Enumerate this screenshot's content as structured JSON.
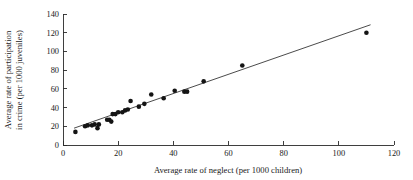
{
  "chart_data": {
    "type": "scatter",
    "title": "",
    "xlabel": "Average rate of neglect (per 1000 children)",
    "ylabel_line1": "Average rate of participation",
    "ylabel_line2": "in crime (per 1000 juveniles)",
    "xlim": [
      0,
      120
    ],
    "ylim": [
      0,
      140
    ],
    "xticks": [
      0,
      20,
      40,
      60,
      80,
      100,
      120
    ],
    "yticks": [
      0,
      20,
      40,
      60,
      80,
      100,
      120,
      140
    ],
    "grid": false,
    "legend": "none",
    "points": [
      {
        "x": 4.5,
        "y": 14
      },
      {
        "x": 8.0,
        "y": 20
      },
      {
        "x": 9.0,
        "y": 21
      },
      {
        "x": 10.5,
        "y": 21
      },
      {
        "x": 11.5,
        "y": 22
      },
      {
        "x": 12.5,
        "y": 18
      },
      {
        "x": 13.0,
        "y": 22
      },
      {
        "x": 16.0,
        "y": 27
      },
      {
        "x": 16.8,
        "y": 27
      },
      {
        "x": 17.5,
        "y": 25
      },
      {
        "x": 18.0,
        "y": 33
      },
      {
        "x": 19.0,
        "y": 33
      },
      {
        "x": 20.0,
        "y": 35
      },
      {
        "x": 21.5,
        "y": 35
      },
      {
        "x": 22.5,
        "y": 37
      },
      {
        "x": 23.5,
        "y": 38
      },
      {
        "x": 24.5,
        "y": 47
      },
      {
        "x": 27.5,
        "y": 41
      },
      {
        "x": 29.5,
        "y": 44
      },
      {
        "x": 32.0,
        "y": 54
      },
      {
        "x": 36.5,
        "y": 50
      },
      {
        "x": 40.5,
        "y": 58
      },
      {
        "x": 44.0,
        "y": 57
      },
      {
        "x": 45.0,
        "y": 57
      },
      {
        "x": 51.0,
        "y": 68
      },
      {
        "x": 65.0,
        "y": 85
      },
      {
        "x": 110.0,
        "y": 120
      }
    ],
    "fit_line": {
      "label": "least-squares fit",
      "x_start": 4.0,
      "y_start": 18.0,
      "x_end": 111.5,
      "y_end": 128.5
    }
  }
}
